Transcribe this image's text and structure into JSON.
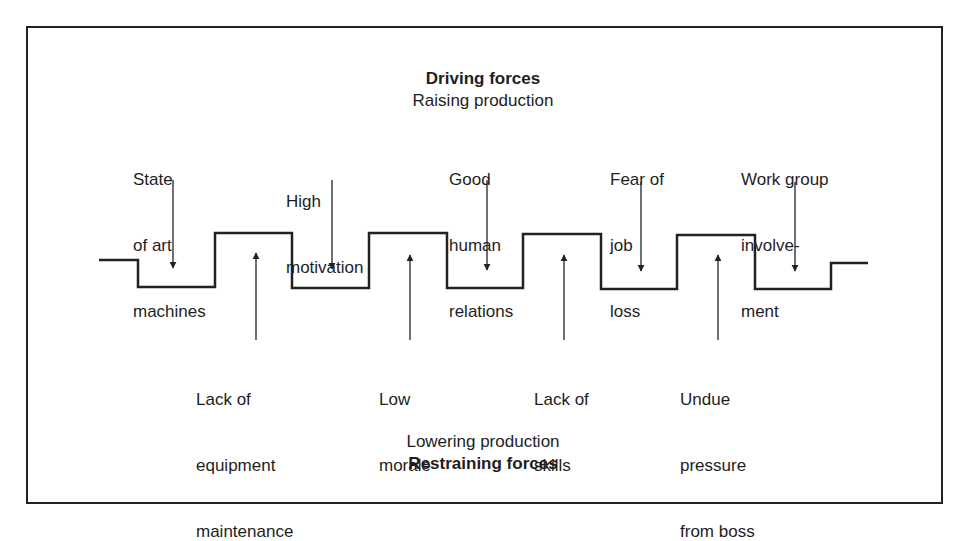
{
  "diagram": {
    "type": "force-field-analysis",
    "top_header": {
      "title": "Driving forces",
      "subtitle": "Raising production"
    },
    "bottom_header": {
      "subtitle": "Lowering production",
      "title": "Restraining forces"
    },
    "driving_forces": [
      {
        "lines": [
          "State",
          "of art",
          "machines"
        ]
      },
      {
        "lines": [
          "High",
          "motivation"
        ]
      },
      {
        "lines": [
          "Good",
          "human",
          "relations"
        ]
      },
      {
        "lines": [
          "Fear of",
          "job",
          "loss"
        ]
      },
      {
        "lines": [
          "Work group",
          "involve-",
          "ment"
        ]
      }
    ],
    "restraining_forces": [
      {
        "lines": [
          "Lack of",
          "equipment",
          "maintenance"
        ]
      },
      {
        "lines": [
          "Low",
          "morale"
        ]
      },
      {
        "lines": [
          "Lack of",
          "skills"
        ]
      },
      {
        "lines": [
          "Undue",
          "pressure",
          "from boss"
        ]
      }
    ],
    "colors": {
      "line": "#222222",
      "text": "#1e1e1e",
      "background": "#ffffff"
    }
  }
}
